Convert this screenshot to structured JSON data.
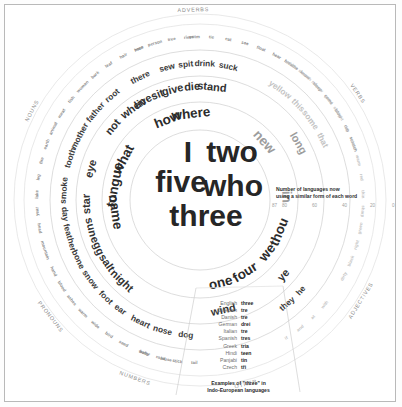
{
  "figure": {
    "center_words": [
      "I",
      "two",
      "five",
      "who",
      "three"
    ],
    "category_labels": {
      "adverbs": "ADVERBS",
      "verbs": "VERBS",
      "adjectives": "ADJECTIVES",
      "other": "OTHER",
      "numbers": "NUMBERS",
      "pronouns": "PRONOUNS",
      "nouns": "NOUNS"
    }
  },
  "legend": {
    "title_line1": "Number of languages now",
    "title_line2": "using a similar form of each word",
    "ticks": [
      "87",
      "80",
      "60",
      "40",
      "20",
      "0"
    ]
  },
  "language_table": {
    "caption_line1": "Examples of \"three\" in",
    "caption_line2": "Indo-European languages",
    "rows": [
      {
        "language": "English",
        "word": "three"
      },
      {
        "language": "Swedish",
        "word": "tre"
      },
      {
        "language": "Danish",
        "word": "tre"
      },
      {
        "language": "German",
        "word": "drei"
      },
      {
        "language": "Italian",
        "word": "tre"
      },
      {
        "language": "Spanish",
        "word": "tres"
      },
      {
        "language": "Greek",
        "word": "tria"
      },
      {
        "language": "Hindi",
        "word": "teen"
      },
      {
        "language": "Panjabi",
        "word": "tin"
      },
      {
        "language": "Czech",
        "word": "tři"
      }
    ]
  },
  "chart_data": {
    "type": "radial-wordcloud",
    "value_axis_label": "Number of languages now using a similar form of each word",
    "value_range": [
      0,
      87
    ],
    "radial_axis_ticks": [
      87,
      80,
      60,
      40,
      20,
      0
    ],
    "categories": [
      "ADVERBS",
      "VERBS",
      "ADJECTIVES",
      "OTHER",
      "NUMBERS",
      "PRONOUNS",
      "NOUNS"
    ],
    "words": [
      {
        "text": "I",
        "category": "PRONOUNS",
        "value": 87,
        "ring": 0,
        "angle": -8
      },
      {
        "text": "two",
        "category": "NUMBERS",
        "value": 87,
        "ring": 0,
        "angle": 8
      },
      {
        "text": "five",
        "category": "NUMBERS",
        "value": 85,
        "ring": 0,
        "angle": -14
      },
      {
        "text": "who",
        "category": "PRONOUNS",
        "value": 85,
        "ring": 0,
        "angle": 16
      },
      {
        "text": "three",
        "category": "NUMBERS",
        "value": 84,
        "ring": 0,
        "angle": 4
      },
      {
        "text": "what",
        "category": "ADVERBS",
        "value": 72,
        "ring": 1,
        "angle": -62
      },
      {
        "text": "how",
        "category": "ADVERBS",
        "value": 72,
        "ring": 1,
        "angle": -22
      },
      {
        "text": "where",
        "category": "ADVERBS",
        "value": 71,
        "ring": 1,
        "angle": -6
      },
      {
        "text": "tongue",
        "category": "NOUNS",
        "value": 70,
        "ring": 1,
        "angle": -80
      },
      {
        "text": "name",
        "category": "NOUNS",
        "value": 70,
        "ring": 1,
        "angle": -98
      },
      {
        "text": "we",
        "category": "PRONOUNS",
        "value": 70,
        "ring": 1,
        "angle": 128
      },
      {
        "text": "four",
        "category": "NUMBERS",
        "value": 69,
        "ring": 1,
        "angle": 148
      },
      {
        "text": "one",
        "category": "NUMBERS",
        "value": 68,
        "ring": 1,
        "angle": 166
      },
      {
        "text": "thou",
        "category": "PRONOUNS",
        "value": 68,
        "ring": 1,
        "angle": 112
      },
      {
        "text": "new",
        "category": "ADJECTIVES",
        "value": 66,
        "ring": 1,
        "angle": 48
      },
      {
        "text": "in",
        "category": "OTHER",
        "value": 64,
        "ring": 1,
        "angle": 88
      },
      {
        "text": "eye",
        "category": "NOUNS",
        "value": 60,
        "ring": 2,
        "angle": -74
      },
      {
        "text": "star",
        "category": "NOUNS",
        "value": 59,
        "ring": 2,
        "angle": -92
      },
      {
        "text": "sun",
        "category": "NOUNS",
        "value": 59,
        "ring": 2,
        "angle": -104
      },
      {
        "text": "egg",
        "category": "NOUNS",
        "value": 58,
        "ring": 2,
        "angle": -114
      },
      {
        "text": "salt",
        "category": "NOUNS",
        "value": 58,
        "ring": 2,
        "angle": -124
      },
      {
        "text": "night",
        "category": "NOUNS",
        "value": 57,
        "ring": 2,
        "angle": -136
      },
      {
        "text": "not",
        "category": "ADVERBS",
        "value": 62,
        "ring": 2,
        "angle": -50
      },
      {
        "text": "when",
        "category": "ADVERBS",
        "value": 61,
        "ring": 2,
        "angle": -36
      },
      {
        "text": "give",
        "category": "VERBS",
        "value": 58,
        "ring": 2,
        "angle": -14
      },
      {
        "text": "die",
        "category": "VERBS",
        "value": 57,
        "ring": 2,
        "angle": -4
      },
      {
        "text": "stand",
        "category": "VERBS",
        "value": 56,
        "ring": 2,
        "angle": 6
      },
      {
        "text": "sit",
        "category": "VERBS",
        "value": 58,
        "ring": 2,
        "angle": -22
      },
      {
        "text": "live",
        "category": "VERBS",
        "value": 58,
        "ring": 2,
        "angle": -30
      },
      {
        "text": "long",
        "category": "ADJECTIVES",
        "value": 54,
        "ring": 2,
        "angle": 60
      },
      {
        "text": "ye",
        "category": "PRONOUNS",
        "value": 54,
        "ring": 2,
        "angle": 132
      },
      {
        "text": "wind",
        "category": "NOUNS",
        "value": 55,
        "ring": 2,
        "angle": 168
      },
      {
        "text": "mother",
        "category": "NOUNS",
        "value": 48,
        "ring": 3,
        "angle": -62
      },
      {
        "text": "tooth",
        "category": "NOUNS",
        "value": 48,
        "ring": 3,
        "angle": -72
      },
      {
        "text": "smoke",
        "category": "NOUNS",
        "value": 47,
        "ring": 3,
        "angle": -86
      },
      {
        "text": "day",
        "category": "NOUNS",
        "value": 46,
        "ring": 3,
        "angle": -96
      },
      {
        "text": "feather",
        "category": "NOUNS",
        "value": 45,
        "ring": 3,
        "angle": -106
      },
      {
        "text": "bone",
        "category": "NOUNS",
        "value": 45,
        "ring": 3,
        "angle": -116
      },
      {
        "text": "snow",
        "category": "NOUNS",
        "value": 45,
        "ring": 3,
        "angle": -126
      },
      {
        "text": "foot",
        "category": "NOUNS",
        "value": 44,
        "ring": 3,
        "angle": -136
      },
      {
        "text": "ear",
        "category": "NOUNS",
        "value": 44,
        "ring": 3,
        "angle": -144
      },
      {
        "text": "heart",
        "category": "NOUNS",
        "value": 43,
        "ring": 3,
        "angle": -154
      },
      {
        "text": "nose",
        "category": "NOUNS",
        "value": 43,
        "ring": 3,
        "angle": -164
      },
      {
        "text": "dog",
        "category": "NOUNS",
        "value": 42,
        "ring": 3,
        "angle": -174
      },
      {
        "text": "father",
        "category": "NOUNS",
        "value": 48,
        "ring": 3,
        "angle": -50
      },
      {
        "text": "root",
        "category": "NOUNS",
        "value": 47,
        "ring": 3,
        "angle": -40
      },
      {
        "text": "there",
        "category": "ADVERBS",
        "value": 46,
        "ring": 3,
        "angle": -26
      },
      {
        "text": "sew",
        "category": "VERBS",
        "value": 44,
        "ring": 3,
        "angle": -14
      },
      {
        "text": "spit",
        "category": "VERBS",
        "value": 43,
        "ring": 3,
        "angle": -6
      },
      {
        "text": "drink",
        "category": "VERBS",
        "value": 42,
        "ring": 3,
        "angle": 2
      },
      {
        "text": "suck",
        "category": "VERBS",
        "value": 42,
        "ring": 3,
        "angle": 12
      },
      {
        "text": "this",
        "category": "ADJECTIVES",
        "value": 42,
        "ring": 3,
        "angle": 46
      },
      {
        "text": "that",
        "category": "ADJECTIVES",
        "value": 41,
        "ring": 3,
        "angle": 64
      },
      {
        "text": "some",
        "category": "ADJECTIVES",
        "value": 40,
        "ring": 3,
        "angle": 54
      },
      {
        "text": "yellow",
        "category": "ADJECTIVES",
        "value": 40,
        "ring": 3,
        "angle": 36
      },
      {
        "text": "they",
        "category": "PRONOUNS",
        "value": 40,
        "ring": 3,
        "angle": 140
      },
      {
        "text": "he",
        "category": "PRONOUNS",
        "value": 39,
        "ring": 3,
        "angle": 132
      },
      {
        "text": "here",
        "category": "ADVERBS",
        "value": 30,
        "ring": 4,
        "angle": -22
      },
      {
        "text": "louse",
        "category": "NOUNS",
        "value": 30,
        "ring": 4,
        "angle": -168
      },
      {
        "text": "water",
        "category": "NOUNS",
        "value": 30,
        "ring": 4,
        "angle": -160
      },
      {
        "text": "seed",
        "category": "NOUNS",
        "value": 29,
        "ring": 4,
        "angle": -152
      },
      {
        "text": "bird",
        "category": "NOUNS",
        "value": 28,
        "ring": 4,
        "angle": -146
      },
      {
        "text": "wide",
        "category": "NOUNS",
        "value": 27,
        "ring": 4,
        "angle": -140
      },
      {
        "text": "warm",
        "category": "NOUNS",
        "value": 27,
        "ring": 4,
        "angle": -134
      },
      {
        "text": "ashes",
        "category": "NOUNS",
        "value": 26,
        "ring": 4,
        "angle": -128
      },
      {
        "text": "blood",
        "category": "NOUNS",
        "value": 26,
        "ring": 4,
        "angle": -122
      },
      {
        "text": "hand",
        "category": "NOUNS",
        "value": 25,
        "ring": 4,
        "angle": -116
      },
      {
        "text": "mountain",
        "category": "NOUNS",
        "value": 25,
        "ring": 4,
        "angle": -108
      },
      {
        "text": "head",
        "category": "NOUNS",
        "value": 24,
        "ring": 4,
        "angle": -100
      },
      {
        "text": "year",
        "category": "NOUNS",
        "value": 24,
        "ring": 4,
        "angle": -94
      },
      {
        "text": "lake",
        "category": "NOUNS",
        "value": 24,
        "ring": 4,
        "angle": -88
      },
      {
        "text": "leg",
        "category": "NOUNS",
        "value": 23,
        "ring": 4,
        "angle": -82
      },
      {
        "text": "fire",
        "category": "NOUNS",
        "value": 23,
        "ring": 4,
        "angle": -76
      },
      {
        "text": "earth",
        "category": "NOUNS",
        "value": 22,
        "ring": 4,
        "angle": -70
      },
      {
        "text": "animal",
        "category": "NOUNS",
        "value": 22,
        "ring": 4,
        "angle": -64
      },
      {
        "text": "meat",
        "category": "NOUNS",
        "value": 21,
        "ring": 4,
        "angle": -58
      },
      {
        "text": "fish",
        "category": "NOUNS",
        "value": 21,
        "ring": 4,
        "angle": -52
      },
      {
        "text": "woman",
        "category": "NOUNS",
        "value": 20,
        "ring": 4,
        "angle": -46
      },
      {
        "text": "bark",
        "category": "NOUNS",
        "value": 20,
        "ring": 4,
        "angle": -40
      },
      {
        "text": "leaf",
        "category": "NOUNS",
        "value": 19,
        "ring": 4,
        "angle": -34
      },
      {
        "text": "hair",
        "category": "NOUNS",
        "value": 19,
        "ring": 4,
        "angle": -28
      },
      {
        "text": "man",
        "category": "NOUNS",
        "value": 18,
        "ring": 4,
        "angle": -22
      },
      {
        "text": "person",
        "category": "NOUNS",
        "value": 18,
        "ring": 4,
        "angle": -16
      },
      {
        "text": "tree",
        "category": "NOUNS",
        "value": 17,
        "ring": 4,
        "angle": -10
      },
      {
        "text": "river",
        "category": "NOUNS",
        "value": 17,
        "ring": 4,
        "angle": -4
      },
      {
        "text": "tail",
        "category": "NOUNS",
        "value": 16,
        "ring": 4,
        "angle": -178
      },
      {
        "text": "stick",
        "category": "NOUNS",
        "value": 16,
        "ring": 4,
        "angle": -172
      },
      {
        "text": "road",
        "category": "NOUNS",
        "value": 16,
        "ring": 4,
        "angle": -166
      },
      {
        "text": "belly",
        "category": "NOUNS",
        "value": 15,
        "ring": 4,
        "angle": -160
      },
      {
        "text": "swim",
        "category": "VERBS",
        "value": 22,
        "ring": 4,
        "angle": -2
      },
      {
        "text": "tie",
        "category": "VERBS",
        "value": 21,
        "ring": 4,
        "angle": 4
      },
      {
        "text": "eat",
        "category": "VERBS",
        "value": 21,
        "ring": 4,
        "angle": 10
      },
      {
        "text": "see",
        "category": "VERBS",
        "value": 20,
        "ring": 4,
        "angle": 16
      },
      {
        "text": "float",
        "category": "VERBS",
        "value": 20,
        "ring": 4,
        "angle": 22
      },
      {
        "text": "hear",
        "category": "VERBS",
        "value": 19,
        "ring": 4,
        "angle": 28
      },
      {
        "text": "breathe",
        "category": "VERBS",
        "value": 19,
        "ring": 4,
        "angle": 34
      },
      {
        "text": "know",
        "category": "VERBS",
        "value": 18,
        "ring": 4,
        "angle": 40
      },
      {
        "text": "sleep",
        "category": "VERBS",
        "value": 18,
        "ring": 4,
        "angle": 46
      },
      {
        "text": "come",
        "category": "VERBS",
        "value": 17,
        "ring": 4,
        "angle": 52
      },
      {
        "text": "blow",
        "category": "VERBS",
        "value": 17,
        "ring": 4,
        "angle": 58
      },
      {
        "text": "rub",
        "category": "VERBS",
        "value": 16,
        "ring": 4,
        "angle": 64
      },
      {
        "text": "scratch",
        "category": "VERBS",
        "value": 16,
        "ring": 4,
        "angle": 70
      },
      {
        "text": "thin",
        "category": "ADJECTIVES",
        "value": 20,
        "ring": 4,
        "angle": 88
      },
      {
        "text": "red",
        "category": "ADJECTIVES",
        "value": 20,
        "ring": 4,
        "angle": 82
      },
      {
        "text": "warm",
        "category": "ADJECTIVES",
        "value": 19,
        "ring": 4,
        "angle": 76
      },
      {
        "text": "short",
        "category": "ADJECTIVES",
        "value": 19,
        "ring": 4,
        "angle": 70
      },
      {
        "text": "dry",
        "category": "ADJECTIVES",
        "value": 18,
        "ring": 4,
        "angle": 64
      },
      {
        "text": "straight",
        "category": "ADJECTIVES",
        "value": 18,
        "ring": 4,
        "angle": 58
      },
      {
        "text": "good",
        "category": "ADJECTIVES",
        "value": 17,
        "ring": 4,
        "angle": 52
      },
      {
        "text": "narrow",
        "category": "ADJECTIVES",
        "value": 17,
        "ring": 4,
        "angle": 46
      },
      {
        "text": "smooth",
        "category": "ADJECTIVES",
        "value": 16,
        "ring": 4,
        "angle": 40
      },
      {
        "text": "white",
        "category": "ADJECTIVES",
        "value": 16,
        "ring": 4,
        "angle": 34
      },
      {
        "text": "green",
        "category": "ADJECTIVES",
        "value": 15,
        "ring": 4,
        "angle": 100
      },
      {
        "text": "sharp",
        "category": "ADJECTIVES",
        "value": 15,
        "ring": 4,
        "angle": 94
      },
      {
        "text": "right",
        "category": "ADJECTIVES",
        "value": 14,
        "ring": 4,
        "angle": 106
      },
      {
        "text": "black",
        "category": "ADJECTIVES",
        "value": 14,
        "ring": 4,
        "angle": 112
      },
      {
        "text": "dirty",
        "category": "ADJECTIVES",
        "value": 13,
        "ring": 4,
        "angle": 118
      },
      {
        "text": "with",
        "category": "OTHER",
        "value": 12,
        "ring": 4,
        "angle": 130
      },
      {
        "text": "at",
        "category": "OTHER",
        "value": 12,
        "ring": 4,
        "angle": 136
      },
      {
        "text": "and",
        "category": "OTHER",
        "value": 11,
        "ring": 4,
        "angle": 142
      },
      {
        "text": "if",
        "category": "OTHER",
        "value": 11,
        "ring": 4,
        "angle": 148
      }
    ]
  }
}
